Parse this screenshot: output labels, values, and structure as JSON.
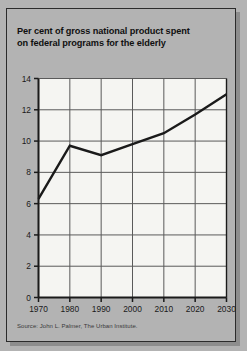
{
  "figure": {
    "title_line1": "Per cent of gross national product spent",
    "title_line2": "on federal programs for the elderly",
    "source": "Source: John L. Palmer, The Urban Institute.",
    "background_color": "#b3b3b3",
    "plot_background_color": "#f5f5f2",
    "line_color": "#1a1a1a",
    "grid_color": "#5a5a5a",
    "frame_color": "#2b2b2b"
  },
  "chart_data": {
    "type": "line",
    "title": "Per cent of gross national product spent on federal programs for the elderly",
    "subtitle": "",
    "xlabel": "",
    "ylabel": "",
    "x": [
      1970,
      1980,
      1990,
      2000,
      2010,
      2020,
      2030
    ],
    "values": [
      6.3,
      9.7,
      9.1,
      9.8,
      10.5,
      11.7,
      13.0
    ],
    "xtick_labels": [
      "1970",
      "1980",
      "1990",
      "2000",
      "2010",
      "2020",
      "2030"
    ],
    "ytick_labels": [
      "0",
      "2",
      "4",
      "6",
      "8",
      "10",
      "12",
      "14"
    ],
    "ytick_values": [
      0,
      2,
      4,
      6,
      8,
      10,
      12,
      14
    ],
    "xlim": [
      1970,
      2030
    ],
    "ylim": [
      0,
      14
    ],
    "grid": true,
    "legend": "none",
    "source": "Source: John L. Palmer, The Urban Institute."
  }
}
